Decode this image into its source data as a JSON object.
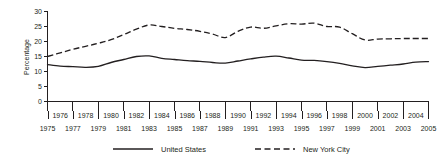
{
  "chart_data": {
    "type": "line",
    "title": "",
    "xlabel": "",
    "ylabel": "Percentage",
    "ylim": [
      0,
      30
    ],
    "yticks": [
      0,
      5,
      10,
      15,
      20,
      25,
      30
    ],
    "xlim": [
      1975,
      2005
    ],
    "grid": false,
    "legend_position": "bottom",
    "x": [
      1975,
      1976,
      1977,
      1978,
      1979,
      1980,
      1981,
      1982,
      1983,
      1984,
      1985,
      1986,
      1987,
      1988,
      1989,
      1990,
      1991,
      1992,
      1993,
      1994,
      1995,
      1996,
      1997,
      1998,
      1999,
      2000,
      2001,
      2002,
      2003,
      2004,
      2005
    ],
    "xticks_upper": [
      "1976",
      "1978",
      "1980",
      "1982",
      "1984",
      "1986",
      "1988",
      "1990",
      "1992",
      "1994",
      "1996",
      "1998",
      "2000",
      "2002",
      "2004"
    ],
    "xticks_upper_values": [
      1976,
      1978,
      1980,
      1982,
      1984,
      1986,
      1988,
      1990,
      1992,
      1994,
      1996,
      1998,
      2000,
      2002,
      2004
    ],
    "xticks_lower": [
      "1975",
      "1977",
      "1979",
      "1981",
      "1983",
      "1985",
      "1987",
      "1989",
      "1991",
      "1993",
      "1995",
      "1997",
      "1999",
      "2001",
      "2003",
      "2005"
    ],
    "xticks_lower_values": [
      1975,
      1977,
      1979,
      1981,
      1983,
      1985,
      1987,
      1989,
      1991,
      1993,
      1995,
      1997,
      1999,
      2001,
      2003,
      2005
    ],
    "series": [
      {
        "name": "United States",
        "style": "solid",
        "color": "#231f20",
        "values": [
          12.3,
          11.8,
          11.6,
          11.4,
          11.7,
          13.0,
          14.0,
          15.0,
          15.2,
          14.4,
          14.0,
          13.6,
          13.4,
          13.0,
          12.8,
          13.5,
          14.2,
          14.8,
          15.1,
          14.5,
          13.8,
          13.7,
          13.3,
          12.7,
          11.9,
          11.3,
          11.7,
          12.1,
          12.5,
          13.1,
          13.3
        ]
      },
      {
        "name": "New York City",
        "style": "dashed",
        "color": "#231f20",
        "values": [
          15.0,
          16.2,
          17.4,
          18.4,
          19.4,
          20.6,
          22.3,
          24.1,
          25.5,
          25.0,
          24.4,
          24.0,
          23.4,
          22.5,
          21.3,
          23.4,
          24.8,
          24.4,
          25.2,
          25.9,
          25.8,
          26.1,
          25.0,
          24.8,
          22.6,
          20.5,
          20.8,
          20.9,
          21.0,
          21.0,
          21.0
        ]
      }
    ]
  },
  "legend": {
    "items": [
      {
        "label": "United States",
        "style": "solid"
      },
      {
        "label": "New York City",
        "style": "dashed"
      }
    ]
  }
}
